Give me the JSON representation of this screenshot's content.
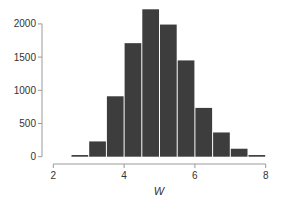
{
  "chart_data": {
    "type": "bar",
    "subtype": "histogram",
    "title": "",
    "xlabel": "W",
    "ylabel": "",
    "bins": [
      [
        2.5,
        3.0
      ],
      [
        3.0,
        3.5
      ],
      [
        3.5,
        4.0
      ],
      [
        4.0,
        4.5
      ],
      [
        4.5,
        5.0
      ],
      [
        5.0,
        5.5
      ],
      [
        5.5,
        6.0
      ],
      [
        6.0,
        6.5
      ],
      [
        6.5,
        7.0
      ],
      [
        7.0,
        7.5
      ],
      [
        7.5,
        8.0
      ]
    ],
    "categories": [
      "2.5-3.0",
      "3.0-3.5",
      "3.5-4.0",
      "4.0-4.5",
      "4.5-5.0",
      "5.0-5.5",
      "5.5-6.0",
      "6.0-6.5",
      "6.5-7.0",
      "7.0-7.5",
      "7.5-8.0"
    ],
    "values": [
      25,
      230,
      910,
      1710,
      2220,
      1990,
      1450,
      735,
      365,
      120,
      25
    ],
    "xlim": [
      2,
      8
    ],
    "ylim": [
      0,
      2000
    ],
    "xticks": [
      2,
      4,
      6,
      8
    ],
    "yticks": [
      0,
      500,
      1000,
      1500,
      2000
    ],
    "xtick_labels": [
      "2",
      "4",
      "6",
      "8"
    ],
    "ytick_labels": [
      "0",
      "500",
      "1000",
      "1500",
      "2000"
    ],
    "grid": false,
    "legend": null,
    "bar_color": "#3d3d3d",
    "axis_color": "#999999"
  }
}
